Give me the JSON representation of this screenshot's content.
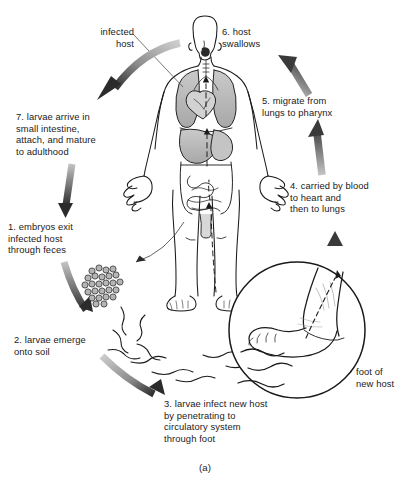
{
  "figure": {
    "caption": "(a)",
    "organism": "human host",
    "colors": {
      "ink": "#1a1a1a",
      "arrow_light": "#c9c9c9",
      "arrow_dark": "#4a4a4a",
      "organ_fill": "#b9b9b9",
      "paper": "#ffffff"
    }
  },
  "labels": {
    "infected_host": "infected\nhost",
    "step1": "1. embryos exit\n    infected host\n    through feces",
    "step2": "2. larvae emerge\n    onto soil",
    "step3": "3. larvae infect new host\n    by penetrating to\n    circulatory system\n    through foot",
    "step4": "4. carried by blood\n    to heart and\n    then to lungs",
    "step5": "5. migrate from\n    lungs to pharynx",
    "step6": "6. host\n    swallows",
    "step7": "7. larvae arrive in\n    small intestine,\n    attach, and mature\n    to adulthood",
    "foot_of_new_host": "foot of\nnew host"
  },
  "icons": {
    "human_body": "human-body-anatomy-icon",
    "foot_inset": "foot-closeup-circle-icon",
    "embryo_cluster": "embryo-eggs-cluster-icon",
    "larvae": "larvae-squiggle-icon",
    "arrow_curved_top": "curved-arrow-icon",
    "arrow_down_left": "down-arrow-icon",
    "arrow_curved_bottom": "curved-arrow-icon",
    "arrow_up_foot": "up-arrow-icon",
    "arrow_up_blood": "up-arrow-icon",
    "arrow_up_pharynx": "up-arrow-icon",
    "arrow_up_swallow": "up-arrow-icon",
    "leader_line": "leader-line-icon",
    "dashed_path": "dashed-migration-path-icon"
  }
}
